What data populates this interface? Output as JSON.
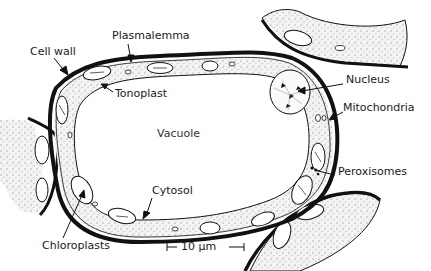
{
  "diagram": {
    "title": "",
    "labels": {
      "plasmalemma": "Plasmalemma",
      "cell_wall": "Cell wall",
      "tonoplast": "Tonoplast",
      "vacuole": "Vacuole",
      "nucleus": "Nucleus",
      "mitochondria": "Mitochondria",
      "peroxisomes": "Peroxisomes",
      "cytosol": "Cytosol",
      "chloroplasts": "Chloroplasts"
    },
    "scale_bar": {
      "label": "10 µm"
    },
    "colors": {
      "ink": "#111111",
      "cytoplasm": "#f2f2f2",
      "background": "#ffffff"
    }
  }
}
